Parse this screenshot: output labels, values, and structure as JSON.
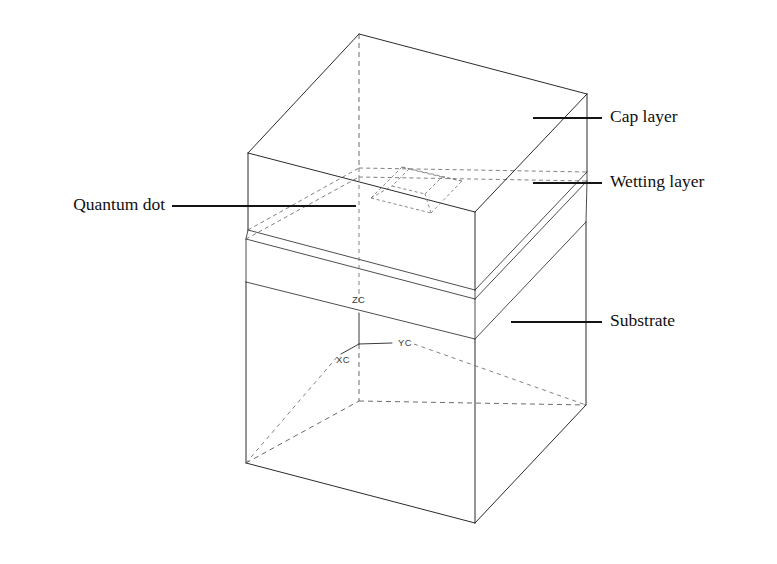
{
  "figure": {
    "background_color": "#ffffff",
    "line_color": "#2b2b2b",
    "hidden_line_color": "#6a6a6a",
    "label_color": "#101010",
    "width": 777,
    "height": 564
  },
  "labels": {
    "cap_layer": "Cap layer",
    "wetting_layer": "Wetting layer",
    "substrate": "Substrate",
    "quantum_dot": "Quantum dot"
  },
  "axes": {
    "z_label": "ZC",
    "y_label": "YC",
    "x_label": "XC",
    "origin_note": "coordinate origin at substrate top surface center"
  },
  "structure": {
    "layers": [
      {
        "name": "Cap layer",
        "position": "top",
        "style": "solid-outline"
      },
      {
        "name": "Wetting layer",
        "position": "middle",
        "style": "thin-slab"
      },
      {
        "name": "Substrate",
        "position": "bottom",
        "style": "solid-outline"
      }
    ],
    "feature": {
      "name": "Quantum dot",
      "shape": "truncated-pyramid",
      "style": "dashed-hidden"
    }
  }
}
